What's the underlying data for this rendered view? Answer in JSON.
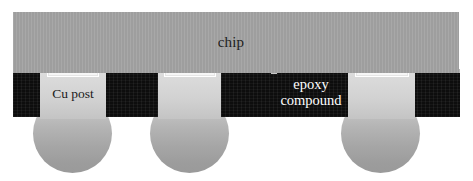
{
  "figure": {
    "type": "cross-section-schematic",
    "background_color": "#ffffff",
    "width": 473,
    "height": 181
  },
  "layers": {
    "chip": {
      "label": "chip",
      "color": "#a3a3a3",
      "label_color": "#1d1d1d"
    },
    "epoxy": {
      "label_line1": "epoxy",
      "label_line2": "compound",
      "color": "#0d0d0d",
      "label_color": "#ffffff"
    },
    "cu_post": {
      "label": "Cu post",
      "color": "#d2d2d2",
      "label_color": "#1b1b1b",
      "count": 3
    },
    "solder_ball": {
      "name": "solder-ball",
      "color_top": "#d2d2d2",
      "color_bottom": "#9a9a9a",
      "count": 3
    },
    "pad": {
      "name": "ubm-pad",
      "color": "#ffffff",
      "count": 3
    },
    "bump": {
      "name": "micro-bump",
      "color": "#c6c6c6"
    }
  }
}
